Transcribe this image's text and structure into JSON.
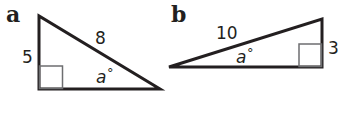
{
  "diagrams": [
    {
      "part_label": "a",
      "shape": "right-triangle",
      "sides": {
        "vertical_leg": "5",
        "hypotenuse": "8"
      },
      "angle": {
        "variable": "a",
        "unit": "°"
      }
    },
    {
      "part_label": "b",
      "shape": "right-triangle",
      "sides": {
        "hypotenuse": "10",
        "vertical_leg": "3"
      },
      "angle": {
        "variable": "a",
        "unit": "°"
      }
    }
  ],
  "colors": {
    "stroke": "#231f20",
    "right_angle_marker": "#6d6e70",
    "background": "#ffffff"
  }
}
